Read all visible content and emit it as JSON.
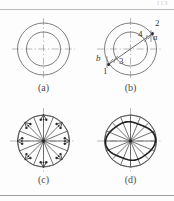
{
  "page": {
    "page_number": "113",
    "background_color": "#fdfdfd",
    "line_color": "#6a6a6a",
    "center_line_color": "#9b9b9b",
    "heavy_line_color": "#2b2b2b"
  },
  "figure": {
    "layout": "2x2 grid of circular ring diagrams",
    "panels": [
      {
        "id": "a",
        "caption": "(a)",
        "description": "two concentric circles with horizontal and vertical dash-dot centre lines",
        "labels": []
      },
      {
        "id": "b",
        "caption": "(b)",
        "description": "concentric ring with an inclined chord line carrying measurement points",
        "labels": [
          {
            "text": "1",
            "style": "roman"
          },
          {
            "text": "2",
            "style": "roman"
          },
          {
            "text": "3",
            "style": "roman"
          },
          {
            "text": "4",
            "style": "roman"
          },
          {
            "text": "a",
            "style": "italic"
          },
          {
            "text": "b",
            "style": "italic"
          }
        ]
      },
      {
        "id": "c",
        "caption": "(c)",
        "description": "ring with sixteen radial spokes and paired arrow vectors around the rim",
        "labels": []
      },
      {
        "id": "d",
        "caption": "(d)",
        "description": "ring with sixteen radial spokes and a heavy distorted inner contour",
        "labels": []
      }
    ]
  }
}
